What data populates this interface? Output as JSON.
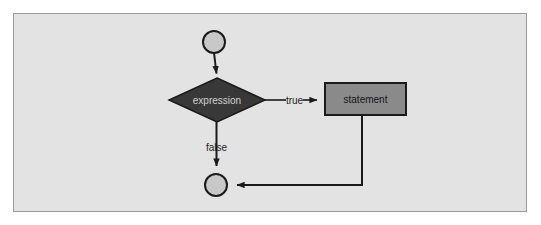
{
  "figure": {
    "kind": "flowchart",
    "page_background": "#ffffff",
    "frame": {
      "background": "#e3e3e3",
      "border_color": "#9a9a9a"
    }
  },
  "palette": {
    "circle_fill": "#c8c8c8",
    "circle_stroke": "#1a1a1a",
    "decision_fill": "#383838",
    "decision_stroke": "#1a1a1a",
    "decision_text": "#d2d2d2",
    "process_fill": "#8a8a8a",
    "process_stroke": "#1a1a1a",
    "process_text": "#15151a",
    "edge_color": "#1a1a1a",
    "label_color": "#1d1d1d"
  },
  "nodes": [
    {
      "id": "entry",
      "type": "terminator-circle",
      "label": "",
      "cx": 214,
      "cy": 42,
      "r": 11
    },
    {
      "id": "expression",
      "type": "decision-diamond",
      "label": "expression",
      "cx": 217,
      "cy": 100,
      "half_width": 48,
      "half_height": 22
    },
    {
      "id": "statement",
      "type": "process-box",
      "label": "statement",
      "x": 325,
      "y": 83,
      "width": 81,
      "height": 32
    },
    {
      "id": "exit",
      "type": "terminator-circle",
      "label": "",
      "cx": 216,
      "cy": 185,
      "r": 11
    }
  ],
  "edges": [
    {
      "id": "entry-to-expression",
      "from": "entry",
      "to": "expression",
      "label": "",
      "arrow": true
    },
    {
      "id": "expression-true-to-statement",
      "from": "expression",
      "to": "statement",
      "label": "true",
      "arrow": true
    },
    {
      "id": "expression-false-to-exit",
      "from": "expression",
      "to": "exit",
      "label": "false",
      "arrow": true
    },
    {
      "id": "statement-to-exit",
      "from": "statement",
      "to": "exit",
      "label": "",
      "arrow": true
    }
  ],
  "labels": {
    "expression": "expression",
    "statement": "statement",
    "true": "true",
    "false": "false"
  }
}
